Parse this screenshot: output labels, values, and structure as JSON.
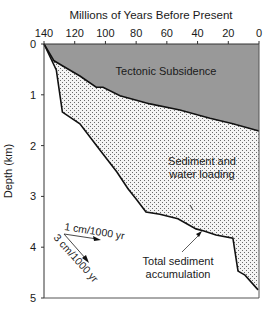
{
  "chart_data": {
    "type": "area",
    "title": "",
    "xlabel": "Millions of Years Before Present",
    "ylabel": "Depth (km)",
    "xlim": [
      140,
      0
    ],
    "ylim": [
      0,
      5
    ],
    "x_ticks": [
      "140",
      "120",
      "100",
      "80",
      "60",
      "40",
      "20",
      "0"
    ],
    "y_ticks": [
      "0",
      "1",
      "2",
      "3",
      "4",
      "5"
    ],
    "x_axis_position": "top",
    "y_axis_inverted": true,
    "grid": false,
    "series": [
      {
        "name": "Tectonic subsidence",
        "x": [
          140,
          133.5,
          128,
          116.6,
          106,
          101.6,
          90.5,
          71,
          51.5,
          32,
          17,
          0
        ],
        "y": [
          0,
          0.33,
          0.43,
          0.63,
          0.85,
          0.85,
          1.02,
          1.18,
          1.3,
          1.46,
          1.57,
          1.71
        ]
      },
      {
        "name": "Total sediment accumulation",
        "x": [
          140,
          132,
          128,
          116.6,
          103.5,
          92.5,
          85.3,
          79.5,
          73.6,
          64.5,
          52.8,
          41,
          35.8,
          28,
          17,
          13.7,
          9.1,
          0.6
        ],
        "y": [
          0,
          0.51,
          1.34,
          1.57,
          2.09,
          2.52,
          2.85,
          3.07,
          3.31,
          3.35,
          3.44,
          3.64,
          3.68,
          3.76,
          3.82,
          4.47,
          4.55,
          4.84
        ]
      }
    ],
    "regions": [
      {
        "label": "Tectonic Subsidence",
        "fill": "#999999",
        "between": [
          "axis-top",
          "Tectonic subsidence"
        ]
      },
      {
        "label": "Sediment and water loading",
        "fill": "stippled",
        "between": [
          "Tectonic subsidence",
          "Total sediment accumulation"
        ]
      }
    ],
    "annotations": [
      {
        "text": "Tectonic Subsidence"
      },
      {
        "text": "Sediment and water loading"
      },
      {
        "text": "Total sediment accumulation",
        "arrow_to": [
          36,
          3.68
        ]
      },
      {
        "text": "1 cm/1000 yr",
        "type": "rate-arrow"
      },
      {
        "text": "3 cm/1000 yr",
        "type": "rate-arrow"
      }
    ]
  },
  "labels": {
    "x_title": "Millions of Years Before Present",
    "y_title": "Depth (km)",
    "region_tectonic": "Tectonic Subsidence",
    "region_sediment_line1": "Sediment and",
    "region_sediment_line2": "water loading",
    "total_line1": "Total sediment",
    "total_line2": "accumulation",
    "rate_1": "1 cm/1000 yr",
    "rate_3": "3 cm/1000 yr"
  },
  "colors": {
    "tectonic_fill": "#999999",
    "stipple_dot": "#5a5a5a",
    "line": "#111111"
  }
}
